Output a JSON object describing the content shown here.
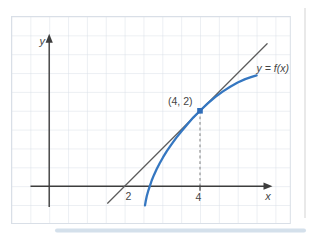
{
  "figure": {
    "axis": {
      "y_label": "y",
      "x_label": "x"
    },
    "ticks": {
      "x": [
        "2",
        "4"
      ]
    },
    "annotations": {
      "point_label": "(4, 2)",
      "curve_label": "y = f(x)"
    }
  },
  "colors": {
    "grid": "#d9dfe7",
    "axis": "#3d3d3d",
    "text": "#454545",
    "curve": "#3577c1",
    "tangent_line": "#5c5c5c",
    "dashed": "#9a9a9a",
    "marker": "#2f6db8",
    "page_strip": "#ccdbe8",
    "page_edge": "#dedede"
  },
  "chart_data": {
    "type": "line",
    "title": "",
    "xlabel": "x",
    "ylabel": "y",
    "xlim": [
      -1,
      6.9
    ],
    "ylim": [
      -1.4,
      4.5
    ],
    "grid": true,
    "grid_cell_units": 0.5,
    "x_ticks_labeled": [
      2,
      4
    ],
    "series": [
      {
        "name": "tangent line through (2, 0) and (4, 2)",
        "role": "tangent",
        "color": "#5c5c5c",
        "points": [
          [
            1.55,
            -0.45
          ],
          [
            5.78,
            3.78
          ]
        ]
      },
      {
        "name": "y = f(x)",
        "role": "curve",
        "color": "#3577c1",
        "points": [
          [
            2.54,
            -0.51
          ],
          [
            2.56,
            -0.4
          ],
          [
            2.59,
            -0.26
          ],
          [
            2.63,
            -0.11
          ],
          [
            2.67,
            0.01
          ],
          [
            2.72,
            0.15
          ],
          [
            2.78,
            0.3
          ],
          [
            2.85,
            0.45
          ],
          [
            2.93,
            0.61
          ],
          [
            3.02,
            0.77
          ],
          [
            3.12,
            0.93
          ],
          [
            3.24,
            1.1
          ],
          [
            3.37,
            1.28
          ],
          [
            3.51,
            1.46
          ],
          [
            3.66,
            1.64
          ],
          [
            3.82,
            1.82
          ],
          [
            4,
            2
          ],
          [
            4.2,
            2.19
          ],
          [
            4.4,
            2.36
          ],
          [
            4.6,
            2.51
          ],
          [
            4.8,
            2.64
          ],
          [
            5,
            2.75
          ],
          [
            5.2,
            2.84
          ],
          [
            5.35,
            2.89
          ],
          [
            5.5,
            2.94
          ]
        ]
      }
    ],
    "marked_point": {
      "x": 4,
      "y": 2,
      "label": "(4, 2)"
    },
    "dashed_drop_line": {
      "from": [
        4,
        2
      ],
      "to": [
        4,
        0
      ]
    },
    "mapping": {
      "origin_px": [
        49.2,
        186.2
      ],
      "px_per_unit": 37.7
    }
  }
}
